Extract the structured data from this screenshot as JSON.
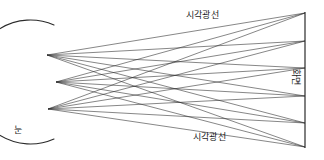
{
  "figure": {
    "background_color": "#ffffff",
    "line_color": "#2b2b2b",
    "text_color": "#1a1a1a",
    "width": 324,
    "height": 160
  },
  "labels": {
    "rays_top": "시각광선",
    "rays_bottom": "시각광선",
    "eye": "눈",
    "screen": "화면"
  },
  "geometry": {
    "eye": {
      "center_x": 28,
      "center_y": 82,
      "radius_x": 60,
      "radius_y": 62,
      "arc_start_x": 54,
      "arc_start_y": 25,
      "arc_end_x": 54,
      "arc_end_y": 139
    },
    "eye_nodes": [
      {
        "x": 47,
        "y": 55
      },
      {
        "x": 56,
        "y": 82
      },
      {
        "x": 48,
        "y": 109
      }
    ],
    "screen": {
      "x": 305,
      "y_top": 12,
      "y_bottom": 148
    },
    "screen_nodes": [
      {
        "x": 305,
        "y": 13
      },
      {
        "x": 305,
        "y": 41
      },
      {
        "x": 305,
        "y": 68
      },
      {
        "x": 305,
        "y": 96
      },
      {
        "x": 305,
        "y": 123
      },
      {
        "x": 305,
        "y": 147
      }
    ]
  }
}
